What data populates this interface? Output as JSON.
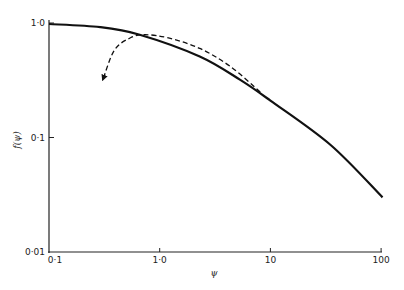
{
  "chart_data": {
    "type": "line",
    "title": "",
    "xlabel": "ψ",
    "ylabel": "f(ψ)",
    "xscale": "log",
    "yscale": "log",
    "xlim": [
      0.1,
      100
    ],
    "ylim": [
      0.01,
      1.0
    ],
    "x_ticks": [
      0.1,
      1.0,
      10,
      100
    ],
    "x_tick_labels": [
      "0·1",
      "1·0",
      "10",
      "100"
    ],
    "y_ticks": [
      0.01,
      0.1,
      1.0
    ],
    "y_tick_labels": [
      "0·01",
      "0·1",
      "1·0"
    ],
    "grid": false,
    "legend": "none",
    "series": [
      {
        "name": "solid",
        "style": "solid",
        "x": [
          0.1,
          0.29,
          0.66,
          2.3,
          5.3,
          10,
          35,
          103
        ],
        "y": [
          0.98,
          0.92,
          0.79,
          0.51,
          0.32,
          0.21,
          0.086,
          0.03
        ]
      },
      {
        "name": "dashed",
        "style": "dashed-arrow",
        "x": [
          8.1,
          4.3,
          2.3,
          1.2,
          0.74,
          0.54,
          0.39,
          0.31
        ],
        "y": [
          0.25,
          0.42,
          0.6,
          0.74,
          0.79,
          0.74,
          0.58,
          0.33
        ]
      }
    ]
  }
}
